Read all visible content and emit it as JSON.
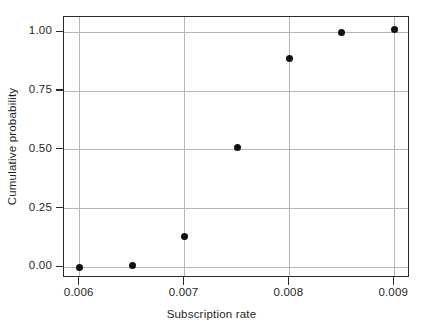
{
  "figure": {
    "caption_remnant": "",
    "background_color": "#ffffff",
    "frame_color": "#2b2b2b",
    "grid_color": "#b5b5b5",
    "marker_color": "#111111"
  },
  "chart_data": {
    "type": "scatter",
    "title": "",
    "xlabel": "Subscription rate",
    "ylabel": "Cumulative probability",
    "xlim": [
      0.00585,
      0.00915
    ],
    "ylim": [
      -0.045,
      1.065
    ],
    "grid": true,
    "legend": null,
    "xticks": [
      0.006,
      0.007,
      0.008,
      0.009
    ],
    "xticklabels": [
      "0.006",
      "0.007",
      "0.008",
      "0.009"
    ],
    "yticks": [
      0.0,
      0.25,
      0.5,
      0.75,
      1.0
    ],
    "yticklabels": [
      "0.00",
      "0.25",
      "0.50",
      "0.75",
      "1.00"
    ],
    "x": [
      0.006,
      0.0065,
      0.007,
      0.0075,
      0.008,
      0.0085,
      0.009
    ],
    "y": [
      0.0,
      0.01,
      0.13,
      0.51,
      0.89,
      1.0,
      1.01
    ],
    "points": [
      {
        "x": 0.006,
        "y": 0.0
      },
      {
        "x": 0.0065,
        "y": 0.01
      },
      {
        "x": 0.007,
        "y": 0.13
      },
      {
        "x": 0.0075,
        "y": 0.51
      },
      {
        "x": 0.008,
        "y": 0.89
      },
      {
        "x": 0.0085,
        "y": 1.0
      },
      {
        "x": 0.009,
        "y": 1.01
      }
    ]
  }
}
